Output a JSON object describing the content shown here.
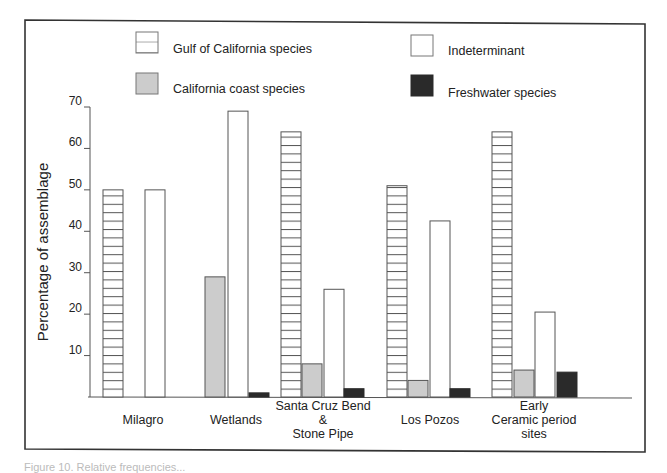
{
  "chart_data": {
    "type": "bar",
    "title": "",
    "xlabel": "",
    "ylabel": "Percentage of assemblage",
    "ylim": [
      0,
      70
    ],
    "yticks": [
      10,
      20,
      30,
      40,
      50,
      60,
      70
    ],
    "grid": false,
    "legend_position": "top",
    "categories": [
      [
        "Milagro"
      ],
      [
        "Wetlands"
      ],
      [
        "Santa Cruz Bend",
        "&",
        "Stone Pipe"
      ],
      [
        "Los Pozos"
      ],
      [
        "Early",
        "Ceramic period",
        "sites"
      ]
    ],
    "series": [
      {
        "name": "Gulf of California species",
        "style": "hatched",
        "color": "#ffffff",
        "values": [
          50,
          0,
          64,
          51,
          64
        ]
      },
      {
        "name": "California coast species",
        "style": "solid",
        "color": "#cccccc",
        "values": [
          0,
          29,
          8,
          4,
          6.5
        ]
      },
      {
        "name": "Indeterminant",
        "style": "solid",
        "color": "#ffffff",
        "values": [
          50,
          69,
          26,
          42.5,
          20.5
        ]
      },
      {
        "name": "Freshwater species",
        "style": "solid",
        "color": "#2a2a2a",
        "values": [
          0,
          1,
          2,
          2,
          6
        ]
      }
    ],
    "legend": [
      {
        "label": "Gulf of California species",
        "series": 0
      },
      {
        "label": "Indeterminant",
        "series": 2
      },
      {
        "label": "California coast species",
        "series": 1
      },
      {
        "label": "Freshwater species",
        "series": 3
      }
    ]
  },
  "caption": "Figure 10. Relative frequencies..."
}
